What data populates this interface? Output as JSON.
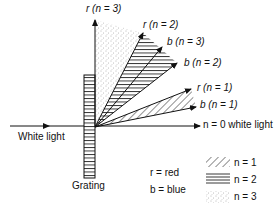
{
  "labels": {
    "white_light": "White light",
    "grating": "Grating",
    "n0": "n = 0 white light",
    "r1": "r (n = 1)",
    "b1": "b (n = 1)",
    "r2": "r (n = 2)",
    "b2": "b (n = 2)",
    "r3": "r (n = 3)",
    "b3": "b (n = 3)"
  },
  "key": {
    "r": "r = red",
    "b": "b = blue"
  },
  "legend": [
    {
      "pattern": "diagonal-hatch",
      "label": "n = 1"
    },
    {
      "pattern": "horizontal-lines",
      "label": "n = 2"
    },
    {
      "pattern": "dots",
      "label": "n = 3"
    }
  ]
}
